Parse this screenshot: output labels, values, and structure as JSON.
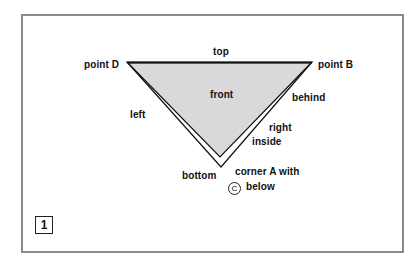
{
  "figure": {
    "number": "1",
    "frame_color": "#8a8a8a",
    "fill_color": "#d9d9d9",
    "triangle": {
      "vertices": {
        "left": "point D",
        "right": "point B",
        "bottom": "corner A"
      }
    },
    "labels": {
      "top": "top",
      "point_d": "point D",
      "point_b": "point B",
      "front": "front",
      "behind": "behind",
      "left": "left",
      "right": "right",
      "inside": "inside",
      "bottom": "bottom",
      "corner_a": "corner A with",
      "below": "below",
      "circle_symbol": "C"
    }
  }
}
